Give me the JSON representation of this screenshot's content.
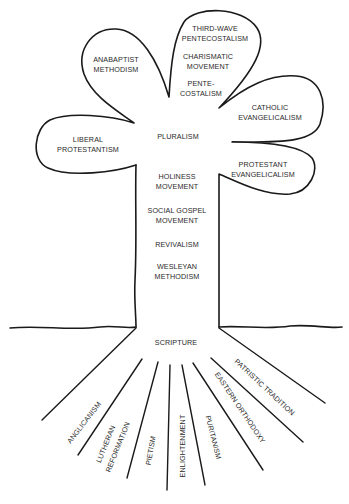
{
  "diagram": {
    "type": "tree",
    "petals": {
      "anabaptist": [
        "ANABAPTIST",
        "METHODISM"
      ],
      "pentecostal_top": [
        "THIRD-WAVE",
        "PENTECOSTALISM"
      ],
      "charismatic": [
        "CHARISMATIC",
        "MOVEMENT"
      ],
      "pentecostalism": [
        "PENTE-",
        "COSTALISM"
      ],
      "catholic_evangelicalism": [
        "CATHOLIC",
        "EVANGELICALISM"
      ],
      "liberal_protestantism": [
        "LIBERAL",
        "PROTESTANTISM"
      ],
      "protestant_evangelicalism": [
        "PROTESTANT",
        "EVANGELICALISM"
      ]
    },
    "center": "PLURALISM",
    "trunk": [
      [
        "HOLINESS",
        "MOVEMENT"
      ],
      [
        "SOCIAL GOSPEL",
        "MOVEMENT"
      ],
      [
        "REVIVALISM"
      ],
      [
        "WESLEYAN",
        "METHODISM"
      ]
    ],
    "base": "SCRIPTURE",
    "roots": [
      [
        "ANGLICANISM"
      ],
      [
        "LUTHERAN",
        "REFORMATION"
      ],
      [
        "PIETISM"
      ],
      [
        "ENLIGHTENMENT"
      ],
      [
        "PURITANISM"
      ],
      [
        "EASTERN ORTHODOXY"
      ],
      [
        "PATRISTIC TRADITION"
      ]
    ],
    "colors": {
      "line": "#1a1a1a",
      "text": "#2a2a2a",
      "background": "#ffffff"
    }
  }
}
